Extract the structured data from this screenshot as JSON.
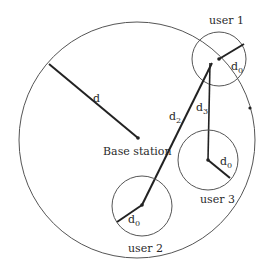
{
  "diagram": {
    "cell": {
      "cx": 137,
      "cy": 140,
      "r": 118,
      "stroke": "#555555"
    },
    "base_station": {
      "x": 138,
      "y": 138,
      "label": "Base station"
    },
    "radius_line": {
      "x1": 49,
      "y1": 64,
      "x2": 138,
      "y2": 138,
      "label": "d"
    },
    "edge_dot": {
      "x": 250,
      "y": 108
    },
    "users": [
      {
        "name": "user 1",
        "cx": 219,
        "cy": 59,
        "r": 27,
        "d0_to": [
          244,
          44
        ],
        "d0_label": "d",
        "d0_sub": "0"
      },
      {
        "name": "user 2",
        "cx": 142,
        "cy": 205,
        "r": 30,
        "d0_to": [
          117,
          222
        ],
        "d0_label": "d",
        "d0_sub": "0"
      },
      {
        "name": "user 3",
        "cx": 208,
        "cy": 160,
        "r": 30,
        "d0_to": [
          230,
          178
        ],
        "d0_label": "d",
        "d0_sub": "0"
      }
    ],
    "links": [
      {
        "label": "d",
        "sub": "2",
        "x1": 212,
        "y1": 63,
        "x2": 142,
        "y2": 205
      },
      {
        "label": "d",
        "sub": "3",
        "x1": 208,
        "y1": 63,
        "x2": 208,
        "y2": 160
      }
    ],
    "text": {
      "d": "d",
      "base_station": "Base station",
      "user1": "user 1",
      "user2": "user 2",
      "user3": "user 3",
      "d_sym": "d",
      "sub0": "0",
      "sub2": "2",
      "sub3": "3"
    }
  }
}
